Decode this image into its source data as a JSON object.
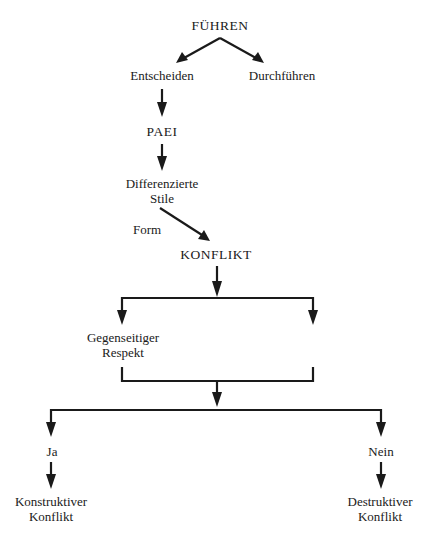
{
  "diagram": {
    "title": "FÜHREN",
    "nodes": {
      "fuehren": "FÜHREN",
      "entscheiden": "Entscheiden",
      "durchfuehren": "Durchführen",
      "paei": "PAEI",
      "differenzierte_stile": [
        "Differenzierte",
        "Stile"
      ],
      "form_label": "Form",
      "konflikt": "KONFLIKT",
      "gegenseitiger_respekt": [
        "Gegenseitiger",
        "Respekt"
      ],
      "ja": "Ja",
      "nein": "Nein",
      "konstruktiver_konflikt": [
        "Konstruktiver",
        "Konflikt"
      ],
      "destruktiver_konflikt": [
        "Destruktiver",
        "Konflikt"
      ]
    },
    "edges": [
      {
        "from": "FÜHREN",
        "to": "Entscheiden"
      },
      {
        "from": "FÜHREN",
        "to": "Durchführen"
      },
      {
        "from": "Entscheiden",
        "to": "PAEI"
      },
      {
        "from": "PAEI",
        "to": "Differenzierte Stile"
      },
      {
        "from": "Differenzierte Stile",
        "to": "KONFLIKT",
        "label": "Form"
      },
      {
        "from": "KONFLIKT",
        "to": "Gegenseitiger Respekt"
      },
      {
        "from": "KONFLIKT",
        "to": "(empty branch)"
      },
      {
        "from": "Gegenseitiger Respekt + (empty branch)",
        "to": "Ja / Nein"
      },
      {
        "from": "Ja",
        "to": "Konstruktiver Konflikt"
      },
      {
        "from": "Nein",
        "to": "Destruktiver Konflikt"
      }
    ],
    "colors": {
      "ink": "#1a1a1a",
      "background": "#ffffff"
    }
  }
}
